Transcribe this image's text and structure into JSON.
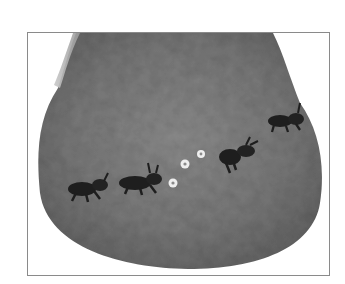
{
  "image": {
    "description": "Grayscale photo of a felted bag with embroidered black ants marching in a line and small white flowers",
    "subject": "felted pouch",
    "colors": {
      "background": "#ffffff",
      "frame_border": "#8a8a8a",
      "felt_dark": "#5f5f5f",
      "felt_mid": "#7a7a7a",
      "felt_light": "#9a9a9a",
      "ant": "#1e1e1e",
      "flower": "#f2f2f2"
    },
    "ants": [
      {
        "x": 70,
        "y": 158,
        "scale": 1.0
      },
      {
        "x": 128,
        "y": 155,
        "scale": 1.0
      },
      {
        "x": 210,
        "y": 118,
        "scale": 0.95
      },
      {
        "x": 258,
        "y": 88,
        "scale": 0.85
      }
    ],
    "flowers": [
      {
        "x": 155,
        "y": 162
      },
      {
        "x": 164,
        "y": 131
      },
      {
        "x": 180,
        "y": 121
      }
    ]
  }
}
